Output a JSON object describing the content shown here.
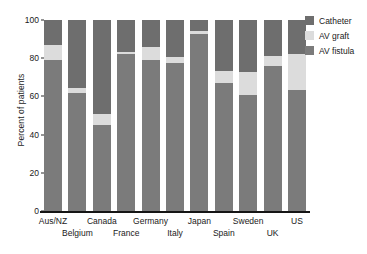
{
  "chart_data": {
    "type": "bar",
    "subtype": "stacked-100-percent",
    "title": "",
    "xlabel": "",
    "ylabel": "Percent of patients",
    "ylim": [
      0,
      100
    ],
    "yticks": [
      0,
      20,
      40,
      60,
      80,
      100
    ],
    "ytick_labels": [
      "0",
      "20",
      "40",
      "60",
      "80",
      "100"
    ],
    "grid": false,
    "legend_position": "right",
    "categories": [
      "Aus/NZ",
      "Belgium",
      "Canada",
      "France",
      "Germany",
      "Italy",
      "Japan",
      "Spain",
      "Sweden",
      "UK",
      "US"
    ],
    "series": [
      {
        "name": "AV fistula",
        "color": "#7b7b7b",
        "values": [
          79,
          62,
          45,
          82,
          79,
          77.5,
          92.5,
          67,
          61,
          76,
          63.5
        ]
      },
      {
        "name": "AV graft",
        "color": "#dcdcdc",
        "values": [
          8,
          2.5,
          6,
          1,
          7,
          3,
          1.5,
          6.5,
          12,
          5,
          18.5
        ]
      },
      {
        "name": "Catheter",
        "color": "#6e6e6e",
        "values": [
          13,
          35.5,
          49,
          17,
          14,
          19.5,
          6,
          26.5,
          27,
          19,
          18
        ]
      }
    ]
  },
  "legend": {
    "items": [
      {
        "label": "Catheter",
        "color": "#6e6e6e"
      },
      {
        "label": "AV graft",
        "color": "#dcdcdc"
      },
      {
        "label": "AV fistula",
        "color": "#7b7b7b"
      }
    ]
  },
  "axes": {
    "y_title": "Percent of patients",
    "x_labels_top": [
      "Aus/NZ",
      "Canada",
      "Germany",
      "Japan",
      "Sweden",
      "US"
    ],
    "x_labels_bottom": [
      "Belgium",
      "France",
      "Italy",
      "Spain",
      "UK"
    ]
  }
}
